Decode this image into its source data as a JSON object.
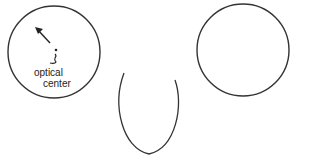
{
  "figure": {
    "left_circle": {
      "label_line1": "optical",
      "label_line2": "center"
    },
    "colors": {
      "stroke": "#333333",
      "background": "#ffffff"
    }
  }
}
